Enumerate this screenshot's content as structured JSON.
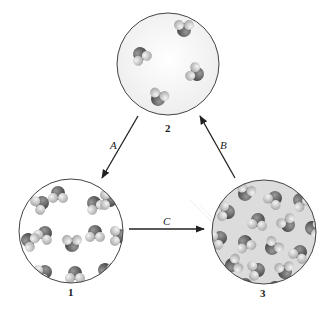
{
  "diagram": {
    "type": "phase-transition-cycle",
    "states": [
      {
        "id": "1",
        "label": "1",
        "description": "ordered packed molecules (solid)",
        "cx": 71,
        "cy": 231,
        "r": 52
      },
      {
        "id": "2",
        "label": "2",
        "description": "sparse molecules (gas)",
        "cx": 168,
        "cy": 64,
        "r": 51
      },
      {
        "id": "3",
        "label": "3",
        "description": "disordered packed molecules (liquid)",
        "cx": 264,
        "cy": 232,
        "r": 52
      }
    ],
    "arrows": [
      {
        "label": "A",
        "from": "2",
        "to": "1"
      },
      {
        "label": "B",
        "from": "3",
        "to": "2"
      },
      {
        "label": "C",
        "from": "1",
        "to": "3"
      }
    ],
    "colors": {
      "oxygen": "#5a5a5a",
      "hydrogen": "#d8d8d8",
      "outline": "#444444",
      "arrow": "#222222"
    }
  }
}
